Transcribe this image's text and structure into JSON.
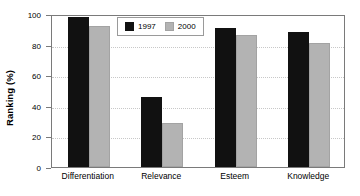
{
  "chart_data": {
    "type": "bar",
    "title": "",
    "xlabel": "",
    "ylabel": "Ranking (%)",
    "categories": [
      "Differentiation",
      "Relevance",
      "Esteem",
      "Knowledge"
    ],
    "series": [
      {
        "name": "1997",
        "color": "#111111",
        "values": [
          98,
          46,
          91,
          88
        ]
      },
      {
        "name": "2000",
        "color": "#b3b3b3",
        "values": [
          92,
          29,
          86,
          81
        ]
      }
    ],
    "ylim": [
      0,
      100
    ],
    "yticks": [
      0,
      20,
      40,
      60,
      80,
      100
    ],
    "ytick_labels": [
      "0",
      "20",
      "40",
      "60",
      "80",
      "100"
    ],
    "grid": true,
    "grid_axis": "y",
    "grid_style": "dotted",
    "legend_position": "upper center",
    "plot_border": true,
    "axis_color": "#7a7a7a",
    "background_color": "#ffffff"
  },
  "legend": {
    "entries": [
      {
        "label": "1997"
      },
      {
        "label": "2000"
      }
    ]
  }
}
